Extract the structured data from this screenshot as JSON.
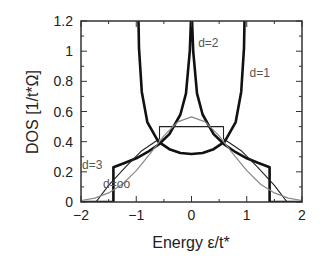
{
  "chart_data": {
    "type": "line",
    "title": "",
    "xlabel": "Energy ε/t*",
    "ylabel": "DOS [1/t*Ω]",
    "xlim": [
      -2,
      2
    ],
    "ylim": [
      0,
      1.2
    ],
    "xticks": [
      -2,
      -1,
      0,
      1,
      2
    ],
    "yticks": [
      0,
      0.2,
      0.4,
      0.6,
      0.8,
      1,
      1.2
    ],
    "xtick_labels": [
      "−2",
      "−1",
      "0",
      "1",
      "2"
    ],
    "ytick_labels": [
      "0",
      "0.2",
      "0.4",
      "0.6",
      "0.8",
      "1",
      "1.2"
    ],
    "grid": false,
    "legend": "inline labels",
    "series": [
      {
        "name": "d=1",
        "label_pos": [
          1.05,
          0.83
        ],
        "style": "thick",
        "x": [
          -0.999,
          -0.995,
          -0.98,
          -0.95,
          -0.9,
          -0.8,
          -0.6,
          -0.4,
          -0.2,
          0,
          0.2,
          0.4,
          0.6,
          0.8,
          0.9,
          0.95,
          0.98,
          0.995,
          0.999
        ],
        "y": [
          7.1,
          3.19,
          1.6,
          1.02,
          0.73,
          0.53,
          0.4,
          0.35,
          0.325,
          0.318,
          0.325,
          0.35,
          0.4,
          0.53,
          0.73,
          1.02,
          1.6,
          3.19,
          7.1
        ]
      },
      {
        "name": "d=2",
        "label_pos": [
          0.12,
          1.03
        ],
        "style": "thick",
        "x": [
          -2,
          -1.414,
          -1.414,
          -1.2,
          -1.0,
          -0.8,
          -0.6,
          -0.4,
          -0.2,
          -0.1,
          -0.03,
          0,
          0.03,
          0.1,
          0.2,
          0.4,
          0.6,
          0.8,
          1.0,
          1.2,
          1.414,
          1.414,
          2
        ],
        "y": [
          0,
          0,
          0.23,
          0.26,
          0.29,
          0.33,
          0.38,
          0.45,
          0.58,
          0.72,
          1.0,
          1.3,
          1.0,
          0.72,
          0.58,
          0.45,
          0.38,
          0.33,
          0.29,
          0.26,
          0.23,
          0,
          0
        ]
      },
      {
        "name": "d=3",
        "label_pos": [
          -1.98,
          0.22
        ],
        "style": "thin",
        "x": [
          -2,
          -1.73,
          -1.5,
          -1.2,
          -0.9,
          -0.58,
          -0.58,
          0,
          0.58,
          0.58,
          0.9,
          1.2,
          1.5,
          1.73,
          2
        ],
        "y": [
          0,
          0,
          0.11,
          0.23,
          0.34,
          0.42,
          0.5,
          0.5,
          0.5,
          0.42,
          0.34,
          0.23,
          0.11,
          0,
          0
        ]
      },
      {
        "name": "d=oo",
        "label_pos": [
          -1.6,
          0.09
        ],
        "style": "grey",
        "x": [
          -2,
          -1.75,
          -1.5,
          -1.25,
          -1,
          -0.75,
          -0.5,
          -0.25,
          0,
          0.25,
          0.5,
          0.75,
          1,
          1.25,
          1.5,
          1.75,
          2
        ],
        "y": [
          0.01,
          0.026,
          0.06,
          0.118,
          0.208,
          0.321,
          0.439,
          0.531,
          0.564,
          0.531,
          0.439,
          0.321,
          0.208,
          0.118,
          0.06,
          0.026,
          0.01
        ]
      }
    ]
  }
}
